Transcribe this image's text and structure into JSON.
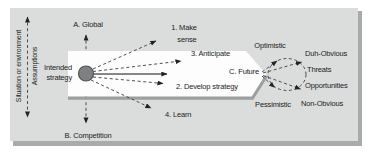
{
  "figure": {
    "type": "strategy-scenario-diagram",
    "sidebar": {
      "axis_label_outer": "Situation or environment",
      "axis_label_inner": "Assumptions"
    },
    "node": {
      "label_lines": [
        "Intended",
        "strategy"
      ]
    },
    "scope": {
      "top": "A. Global",
      "bottom": "B. Competition"
    },
    "steps": {
      "make_sense_lines": [
        "1. Make",
        "sense"
      ],
      "develop_strategy": "2. Develop strategy",
      "anticipate": "3. Anticipate",
      "learn": "4. Learn"
    },
    "future": {
      "label": "C. Future",
      "optimistic": "Optimistic",
      "pessimistic": "Pessimistic",
      "outcomes": [
        "Duh-Obvious",
        "Threats",
        "Opportunities",
        "Non-Obvious"
      ]
    }
  },
  "colors": {
    "panel_bg": "#dbdcdc",
    "panel_shadow": "#a9abab",
    "band_fill": "#fdfdfd",
    "band_shadow": "#9c9ea0",
    "circle_fill": "#7d8183",
    "circle_stroke": "#4f5254",
    "line": "#3c3c3c",
    "text": "#1c1c1c"
  }
}
